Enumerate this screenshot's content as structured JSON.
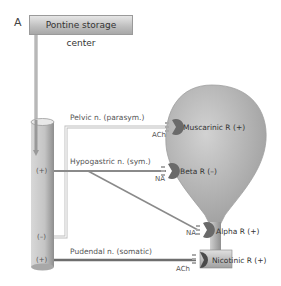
{
  "panel_label": "A",
  "center": {
    "label": "Pontine storage center"
  },
  "spinal_cord": {
    "markers": [
      {
        "label": "(+)",
        "id": "hypogastric"
      },
      {
        "label": "(–)",
        "id": "pelvic"
      },
      {
        "label": "(+)",
        "id": "pudendal"
      }
    ]
  },
  "nerves": [
    {
      "label": "Pelvic n. (parasym.)",
      "transmitter": "ACh"
    },
    {
      "label": "Hypogastric n. (sym.)",
      "transmitter": "NA"
    },
    {
      "label": "Pudendal n. (somatic)",
      "transmitter": "ACh"
    }
  ],
  "alpha_transmitter": "NA",
  "receptors": [
    {
      "label": "Muscarinic R (+)"
    },
    {
      "label": "Beta R (–)"
    },
    {
      "label": "Alpha R (+)"
    },
    {
      "label": "Nicotinic R (+)"
    }
  ],
  "colors": {
    "bladder": "#b8b8b8",
    "receptor": "#6a6a6a",
    "line": "#8a8a8a",
    "box": "#bdbdbd"
  }
}
